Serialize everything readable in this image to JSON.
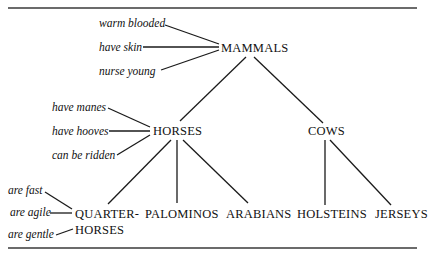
{
  "diagram": {
    "type": "semantic-hierarchy-tree",
    "nodes": {
      "mammals": "MAMMALS",
      "horses": "HORSES",
      "cows": "COWS",
      "quarter_horses_line1": "QUARTER-",
      "quarter_horses_line2": "HORSES",
      "palominos": "PALOMINOS",
      "arabians": "ARABIANS",
      "holsteins": "HOLSTEINS",
      "jerseys": "JERSEYS"
    },
    "attributes": {
      "mammals": [
        "warm blooded",
        "have skin",
        "nurse young"
      ],
      "horses": [
        "have manes",
        "have hooves",
        "can be ridden"
      ],
      "quarter_horses": [
        "are fast",
        "are agile",
        "are gentle"
      ]
    },
    "edges": [
      [
        "MAMMALS",
        "HORSES"
      ],
      [
        "MAMMALS",
        "COWS"
      ],
      [
        "HORSES",
        "QUARTER-HORSES"
      ],
      [
        "HORSES",
        "PALOMINOS"
      ],
      [
        "HORSES",
        "ARABIANS"
      ],
      [
        "COWS",
        "HOLSTEINS"
      ],
      [
        "COWS",
        "JERSEYS"
      ]
    ]
  }
}
